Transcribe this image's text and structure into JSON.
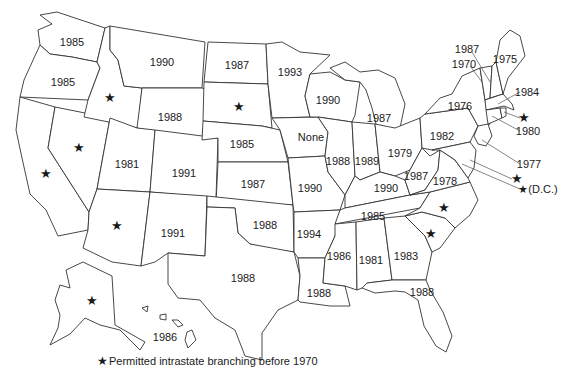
{
  "map": {
    "title": "Year of intrastate branching deregulation by state",
    "star_glyph": "★",
    "legend": {
      "star": "★",
      "text": "Permitted intrastate branching before 1970"
    },
    "states": [
      {
        "id": "WA",
        "label": "1985",
        "x": 72,
        "y": 42
      },
      {
        "id": "OR",
        "label": "1985",
        "x": 63,
        "y": 82
      },
      {
        "id": "CA",
        "label": "★",
        "x": 46,
        "y": 174,
        "star": true
      },
      {
        "id": "NV",
        "label": "★",
        "x": 79,
        "y": 148,
        "star": true
      },
      {
        "id": "ID",
        "label": "★",
        "x": 110,
        "y": 98,
        "star": true
      },
      {
        "id": "MT",
        "label": "1990",
        "x": 162,
        "y": 62
      },
      {
        "id": "WY",
        "label": "1988",
        "x": 170,
        "y": 117
      },
      {
        "id": "UT",
        "label": "1981",
        "x": 127,
        "y": 164
      },
      {
        "id": "CO",
        "label": "1991",
        "x": 184,
        "y": 173
      },
      {
        "id": "AZ",
        "label": "★",
        "x": 117,
        "y": 226,
        "star": true
      },
      {
        "id": "NM",
        "label": "1991",
        "x": 173,
        "y": 233
      },
      {
        "id": "ND",
        "label": "1987",
        "x": 237,
        "y": 65
      },
      {
        "id": "SD",
        "label": "★",
        "x": 239,
        "y": 107,
        "star": true
      },
      {
        "id": "NE",
        "label": "1985",
        "x": 242,
        "y": 144
      },
      {
        "id": "KS",
        "label": "1987",
        "x": 253,
        "y": 184
      },
      {
        "id": "OK",
        "label": "1988",
        "x": 265,
        "y": 225
      },
      {
        "id": "TX",
        "label": "1988",
        "x": 243,
        "y": 278
      },
      {
        "id": "MN",
        "label": "1993",
        "x": 290,
        "y": 72
      },
      {
        "id": "IA",
        "label": "None",
        "x": 311,
        "y": 137
      },
      {
        "id": "MO",
        "label": "1990",
        "x": 310,
        "y": 188
      },
      {
        "id": "AR",
        "label": "1994",
        "x": 309,
        "y": 234
      },
      {
        "id": "LA",
        "label": "1988",
        "x": 319,
        "y": 293
      },
      {
        "id": "WI",
        "label": "1990",
        "x": 328,
        "y": 100
      },
      {
        "id": "IL",
        "label": "1988",
        "x": 338,
        "y": 161
      },
      {
        "id": "MI",
        "label": "1987",
        "x": 379,
        "y": 118
      },
      {
        "id": "IN",
        "label": "1989",
        "x": 367,
        "y": 161
      },
      {
        "id": "OH",
        "label": "1979",
        "x": 400,
        "y": 153
      },
      {
        "id": "KY",
        "label": "1990",
        "x": 386,
        "y": 188
      },
      {
        "id": "TN",
        "label": "1985",
        "x": 373,
        "y": 216
      },
      {
        "id": "MS",
        "label": "1986",
        "x": 339,
        "y": 256
      },
      {
        "id": "AL",
        "label": "1981",
        "x": 371,
        "y": 260
      },
      {
        "id": "GA",
        "label": "1983",
        "x": 406,
        "y": 256
      },
      {
        "id": "FL",
        "label": "1988",
        "x": 422,
        "y": 292
      },
      {
        "id": "SC",
        "label": "★",
        "x": 431,
        "y": 234,
        "star": true
      },
      {
        "id": "NC",
        "label": "★",
        "x": 444,
        "y": 208,
        "star": true
      },
      {
        "id": "WV",
        "label": "1987",
        "x": 416,
        "y": 176
      },
      {
        "id": "VA",
        "label": "1978",
        "x": 445,
        "y": 181
      },
      {
        "id": "PA",
        "label": "1982",
        "x": 442,
        "y": 136
      },
      {
        "id": "NY",
        "label": "1976",
        "x": 460,
        "y": 106
      },
      {
        "id": "ME",
        "label": "1975",
        "x": 505,
        "y": 59
      },
      {
        "id": "AK",
        "label": "★",
        "x": 92,
        "y": 301,
        "star": true
      },
      {
        "id": "HI",
        "label": "1986",
        "x": 165,
        "y": 337
      }
    ],
    "callouts": [
      {
        "id": "VT",
        "label": "1987",
        "x": 467,
        "y": 49
      },
      {
        "id": "NH",
        "label": "1970",
        "x": 464,
        "y": 64
      },
      {
        "id": "MA",
        "label": "1984",
        "x": 527,
        "y": 92
      },
      {
        "id": "RI",
        "label": "★",
        "x": 524,
        "y": 118,
        "star": true
      },
      {
        "id": "CT",
        "label": "1980",
        "x": 528,
        "y": 131
      },
      {
        "id": "NJ",
        "label": "1977",
        "x": 529,
        "y": 164
      },
      {
        "id": "DE",
        "label": "★",
        "x": 517,
        "y": 179,
        "star": true
      },
      {
        "id": "DC",
        "label": "★(D.C.)",
        "x": 538,
        "y": 189
      }
    ]
  }
}
